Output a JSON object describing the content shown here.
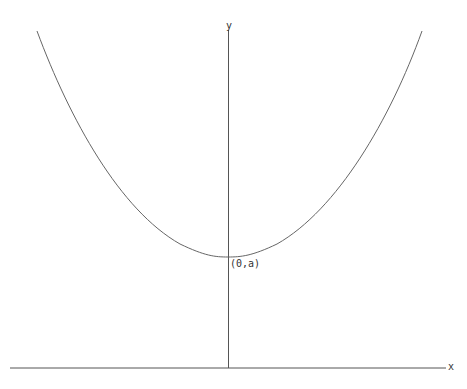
{
  "diagram": {
    "type": "catenary-like curve (upward parabola) on coordinate axes",
    "axes": {
      "x_label": "x",
      "y_label": "y"
    },
    "point_label": "(0,a)",
    "colors": {
      "axis": "#555555",
      "curve": "#666666",
      "text": "#333333"
    }
  }
}
